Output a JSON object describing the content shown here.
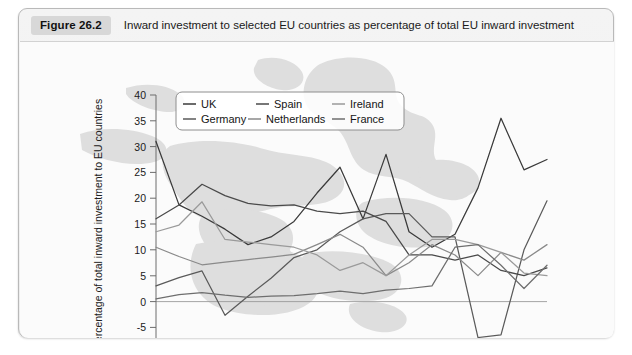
{
  "figure": {
    "badge": "Figure 26.2",
    "title": "Inward investment to selected EU countries as percentage of total EU inward investment"
  },
  "chart_data": {
    "type": "line",
    "title": "Inward investment to selected EU countries as percentage of total EU inward investment",
    "xlabel": "",
    "ylabel": "Percentage of total inward investment to EU countries",
    "x": [
      1990,
      1991,
      1992,
      1993,
      1994,
      1995,
      1996,
      1997,
      1998,
      1999,
      2000,
      2001,
      2002,
      2003,
      2004,
      2005,
      2006,
      2007
    ],
    "xtick_labels": [
      "1990",
      "1992",
      "1994",
      "1996",
      "1998",
      "2000",
      "2002",
      "2004",
      "2006"
    ],
    "xtick_values": [
      1990,
      1992,
      1994,
      1996,
      1998,
      2000,
      2002,
      2004,
      2006
    ],
    "xlim": [
      1990,
      2007
    ],
    "ylim": [
      -10,
      40
    ],
    "ytick_values": [
      -10,
      -5,
      0,
      5,
      10,
      15,
      20,
      25,
      30,
      35,
      40
    ],
    "ytick_labels": [
      "-10",
      "-5",
      "0",
      "5",
      "10",
      "15",
      "20",
      "25",
      "30",
      "35",
      "40"
    ],
    "grid": false,
    "zero_line": true,
    "legend_position": "upper-left-inside",
    "series": [
      {
        "name": "UK",
        "color": "#3a3a3a",
        "values": [
          31.0,
          18.7,
          16.5,
          14.0,
          11.0,
          12.5,
          15.5,
          21.0,
          26.0,
          16.0,
          28.5,
          13.5,
          10.5,
          13.0,
          22.0,
          35.5,
          25.5,
          27.5
        ]
      },
      {
        "name": "Germany",
        "color": "#5a5a5a",
        "values": [
          3.0,
          4.6,
          5.9,
          -2.7,
          1.0,
          4.5,
          8.5,
          10.0,
          13.5,
          16.0,
          17.0,
          17.0,
          12.5,
          12.5,
          -7.0,
          -6.5,
          10.0,
          19.5
        ]
      },
      {
        "name": "Spain",
        "color": "#4a4a4a",
        "values": [
          16.0,
          18.7,
          22.7,
          20.5,
          19.0,
          18.5,
          18.7,
          17.5,
          17.0,
          17.5,
          15.5,
          9.0,
          9.0,
          8.0,
          9.0,
          6.0,
          5.0,
          6.5
        ]
      },
      {
        "name": "Netherlands",
        "color": "#8a8a8a",
        "values": [
          10.5,
          8.7,
          7.1,
          7.6,
          8.1,
          8.6,
          9.1,
          11.0,
          13.0,
          10.5,
          5.0,
          7.5,
          11.0,
          9.0,
          5.0,
          9.5,
          8.0,
          11.0
        ]
      },
      {
        "name": "Ireland",
        "color": "#9a9a9a",
        "values": [
          13.5,
          14.8,
          19.3,
          12.0,
          11.5,
          11.0,
          10.5,
          9.0,
          6.0,
          7.5,
          5.0,
          9.0,
          12.0,
          12.0,
          11.0,
          9.5,
          5.5,
          5.0
        ]
      },
      {
        "name": "France",
        "color": "#6e6e6e",
        "values": [
          0.5,
          1.3,
          1.7,
          1.2,
          0.8,
          1.0,
          1.1,
          1.5,
          2.0,
          1.5,
          2.2,
          2.5,
          3.0,
          10.5,
          11.0,
          7.0,
          2.5,
          7.0
        ]
      }
    ]
  },
  "legend": {
    "entries": [
      {
        "label": "UK"
      },
      {
        "label": "Spain"
      },
      {
        "label": "Ireland"
      },
      {
        "label": "Germany"
      },
      {
        "label": "Netherlands"
      },
      {
        "label": "France"
      }
    ]
  }
}
